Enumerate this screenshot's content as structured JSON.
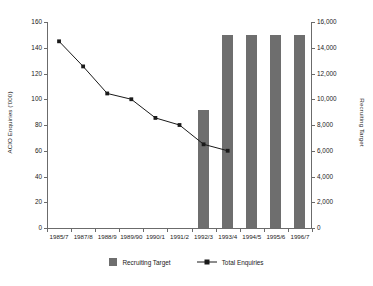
{
  "chart_data": {
    "type": "bar",
    "title": "",
    "subtitle": "",
    "xlabel": "",
    "ylabel": "ACIO Enquiries ('000)",
    "y2label": "Recruiting Target",
    "grid": false,
    "legend_position": "bottom",
    "categories": [
      "1985/7",
      "1987/8",
      "1988/9",
      "1989/90",
      "1990/1",
      "1991/2",
      "1992/3",
      "1993/4",
      "1994/5",
      "1995/6",
      "1996/7"
    ],
    "ylim": [
      0,
      160
    ],
    "yticks": [
      0,
      20,
      40,
      60,
      80,
      100,
      120,
      140,
      160
    ],
    "ytick_labels": [
      "0",
      "20",
      "40",
      "60",
      "80",
      "100",
      "120",
      "140",
      "160"
    ],
    "y2lim": [
      0,
      16000
    ],
    "y2ticks": [
      0,
      2000,
      4000,
      6000,
      8000,
      10000,
      12000,
      14000,
      16000
    ],
    "y2tick_labels": [
      "0",
      "2,000",
      "4,000",
      "6,000",
      "8,000",
      "10,000",
      "12,000",
      "14,000",
      "16,000"
    ],
    "series": [
      {
        "name": "Recruiting Target",
        "type": "bar",
        "axis": "right",
        "color": "#6e6e6e",
        "values": [
          null,
          null,
          null,
          null,
          null,
          null,
          9200,
          15000,
          15000,
          15000,
          15000
        ]
      },
      {
        "name": "Total Enquiries",
        "type": "line",
        "axis": "left",
        "color": "#1a1a1a",
        "marker": "square",
        "values": [
          145,
          125.5,
          104.5,
          100,
          85.5,
          80,
          65,
          60,
          null,
          null,
          null
        ]
      }
    ]
  },
  "legend": {
    "items": [
      {
        "label": "Recruiting Target",
        "marker": "filled-square",
        "color": "#6e6e6e"
      },
      {
        "label": "Total Enquiries",
        "marker": "line-with-square",
        "color": "#1a1a1a"
      }
    ]
  },
  "colors": {
    "bar": "#6e6e6e",
    "line": "#1a1a1a",
    "axis": "#6b6b6b",
    "text": "#1a1a1a",
    "background": "#ffffff"
  }
}
